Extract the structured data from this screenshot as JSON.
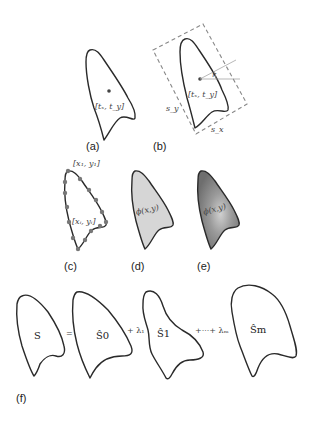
{
  "panels": {
    "a": {
      "label": "(a)",
      "center_label": "[t_x, t_y]",
      "center_text": "[tₓ, t_y]"
    },
    "b": {
      "label": "(b)",
      "center_text": "[tₓ, t_y]",
      "angle_label": "r",
      "scale_y_label": "s_y",
      "scale_x_label": "s_x"
    },
    "c": {
      "label": "(c)",
      "first_point_label": "[x₁, y₁]",
      "point_label": "[xᵢ, yᵢ]"
    },
    "d": {
      "label": "(d)",
      "field_label": "ϕ(x,y)",
      "fill_color": "#d6d6d6"
    },
    "e": {
      "label": "(e)",
      "field_label": "ϕ(x,y)",
      "fill_color_dark": "#7a7a7a",
      "fill_color_light": "#c9c9c9"
    },
    "f": {
      "label": "(f)",
      "shape_s": "S",
      "equals": "=",
      "shape_s0": "Ŝ0",
      "plus_lambda1": "+ λ₁",
      "shape_s1": "Ŝ1",
      "plus_dots_lambda_m": "+···+ λₘ",
      "shape_sm": "Ŝm"
    }
  }
}
